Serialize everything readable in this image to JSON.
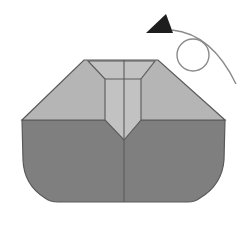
{
  "diagram": {
    "type": "origami-step",
    "colors": {
      "background": "#ffffff",
      "upper_layer": "#b5b5b5",
      "inner_flap": "#c4c4c4",
      "lower_layer": "#7f7f7f",
      "line": "#5a5a5a",
      "arrow": "#1e1e1e",
      "arrow_path": "#8a8a8a"
    },
    "instruction_arrow": {
      "icon": "turn-over-arrow-icon",
      "meaning": "turn model over"
    }
  }
}
